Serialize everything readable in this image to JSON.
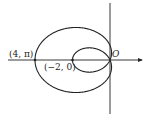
{
  "diagram": {
    "type": "polar-curve-limacon",
    "equation": "r = 1 - 3cos(theta)",
    "labels": {
      "point_outer": "(4, π)",
      "point_inner": "(−2, 0)",
      "origin": "O"
    },
    "points": [
      {
        "label": "(4, π)",
        "r": 4,
        "theta": "π"
      },
      {
        "label": "(−2, 0)",
        "r": -2,
        "theta": "0"
      }
    ],
    "axes": {
      "polar_axis": "horizontal arrow to the right",
      "vertical_line": true
    },
    "colors": {
      "stroke": "#222222",
      "background": "#ffffff"
    }
  }
}
